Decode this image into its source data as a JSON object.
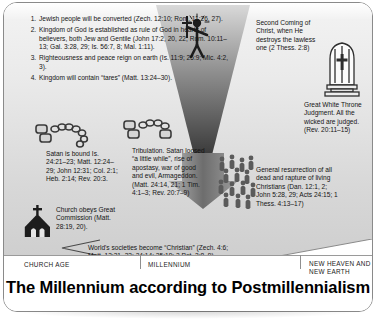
{
  "title": "The Millennium according to Postmillennialism",
  "eras": {
    "church_age": "CHURCH AGE",
    "millennium": "MILLENNIUM",
    "new_heaven": "NEW HEAVEN AND NEW EARTH"
  },
  "numbered_points": [
    "Jewish people will be converted (Zech. 12:10; Rom. 11:26, 27).",
    "Kingdom of God is established as rule of God in hearts of believers, both Jew and Gentile (John 17:2, 20, 22; Rom. 10:11–13; Gal. 3:28, 29; Is. 56:7, 8; Mal. 1:11).",
    "Righteousness and peace reign on earth (Is. 11:9; 25:9; Mic. 4:2, 3).",
    "Kingdom will contain “tares” (Matt. 13:24–30)."
  ],
  "blocks": {
    "second_coming": "Second Coming of Christ, when He destroys the lawless one (2 Thess. 2:8)",
    "great_white_throne": "Great White Throne Judgment. All the wicked are judged. (Rev. 20:11–15)",
    "satan_bound": "Satan is bound Is. 24:21–23; Matt. 12:24–29; John 12:31; Col. 2:1; Heb. 2:14; Rev. 20:3.",
    "tribulation": "Tribulation. Satan loosed “a little while”, rise of apostasy, war of good and evil, Armageddon. (Matt. 24:14, 21; 1 Tim. 4:1–3; Rev. 20:7–9)",
    "general_resurrection": "General resurrection of all dead and rapture of living Christians (Dan. 12:1, 2; John 5:28, 29; Acts 24:15; 1 Thess. 4:13–17)",
    "church_commission": "Church obeys Great Commission (Matt. 28:19, 20).",
    "world_societies": "World's societies become “Christian” (Zech. 4:6; Matt. 13:31–33; 24:14; 25:19; 2 Pet. 3:8, 9)."
  },
  "icons": {
    "funnel": "downward-funnel-arrow",
    "throne": "throne-with-cross",
    "chain": "broken-chain",
    "chain2": "broken-chain",
    "church": "church-building",
    "stickman": "christ-figure-with-sword",
    "crowd": "crowd-of-people",
    "arrow": "small-arrow"
  },
  "colors": {
    "page_bg": "#ffffff",
    "band_top": "#e3e3e3",
    "ink": "#141414",
    "graphic_dark": "#2b2b2b",
    "graphic_mid": "#8c8c8c"
  }
}
